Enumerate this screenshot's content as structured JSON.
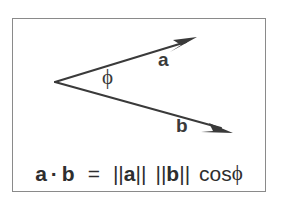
{
  "figure": {
    "caption_text": "a · b  =  ||a|| ||b|| cosϕ",
    "frame_color": "#8a8a8a",
    "background_color": "#ffffff",
    "ink_color": "#3a3a3a"
  },
  "diagram": {
    "vectors": [
      {
        "name": "a",
        "label": "a",
        "origin": [
          55,
          82
        ],
        "tip": [
          196,
          38
        ],
        "direction": "up-right"
      },
      {
        "name": "b",
        "label": "b",
        "origin": [
          55,
          82
        ],
        "tip": [
          232,
          133
        ],
        "direction": "down-right"
      }
    ],
    "angle": {
      "symbol": "ϕ",
      "name": "phi",
      "between": [
        "a",
        "b"
      ]
    }
  },
  "formula": {
    "lhs_vector_1": "a",
    "dot_operator": "·",
    "lhs_vector_2": "b",
    "equals": "=",
    "norm_open": "||",
    "norm_close": "||",
    "rhs_vector_1": "a",
    "rhs_vector_2": "b",
    "cos_function": "cos",
    "angle_symbol": "ϕ"
  }
}
